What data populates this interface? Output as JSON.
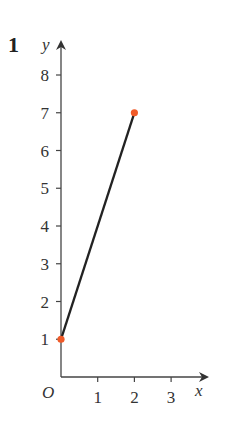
{
  "question_number": "1",
  "chart_data": {
    "type": "line",
    "title": "",
    "xlabel": "x",
    "ylabel": "y",
    "origin_label": "O",
    "x_ticks": [
      "1",
      "2",
      "3"
    ],
    "y_ticks": [
      "1",
      "2",
      "3",
      "4",
      "5",
      "6",
      "7",
      "8"
    ],
    "xlim": [
      0,
      3.5
    ],
    "ylim": [
      0,
      8.5
    ],
    "grid": false,
    "series": [
      {
        "name": "segment",
        "x": [
          0,
          2
        ],
        "y": [
          1,
          7
        ],
        "color": "#222222"
      }
    ],
    "points": [
      {
        "x": 0,
        "y": 1,
        "color": "#f05a28"
      },
      {
        "x": 2,
        "y": 7,
        "color": "#f05a28"
      }
    ]
  }
}
